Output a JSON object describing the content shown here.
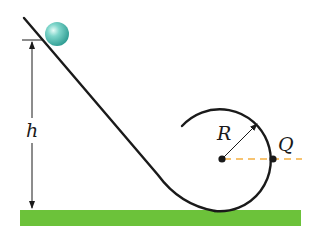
{
  "diagram": {
    "type": "physics-loop-the-loop",
    "labels": {
      "height": "h",
      "radius": "R",
      "point": "Q"
    },
    "colors": {
      "ground": "#6cc23a",
      "ball": "#5fc4b8",
      "track": "#1a1a1a",
      "reference_line": "#f5b041"
    },
    "elements": [
      "ramp",
      "ball",
      "height-dimension-arrow",
      "circular-loop",
      "radius-arrow",
      "center-point",
      "point-Q",
      "horizontal-dashed-reference-line",
      "ground"
    ]
  }
}
